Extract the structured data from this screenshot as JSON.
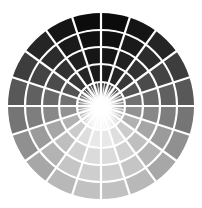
{
  "figure": {
    "type": "radial-grayscale-wheel",
    "center": [
      101,
      106
    ],
    "outer_radius": 93,
    "ring_radii": [
      24,
      42,
      59,
      76,
      93
    ],
    "sectors": 20,
    "inner_rays": 40,
    "gap_color": "#ffffff",
    "gap_width": 2.2,
    "darkest_color": "#0a0a0a",
    "lightest_color": "#c8c8c8",
    "center_glow_color": "#ffffff"
  }
}
